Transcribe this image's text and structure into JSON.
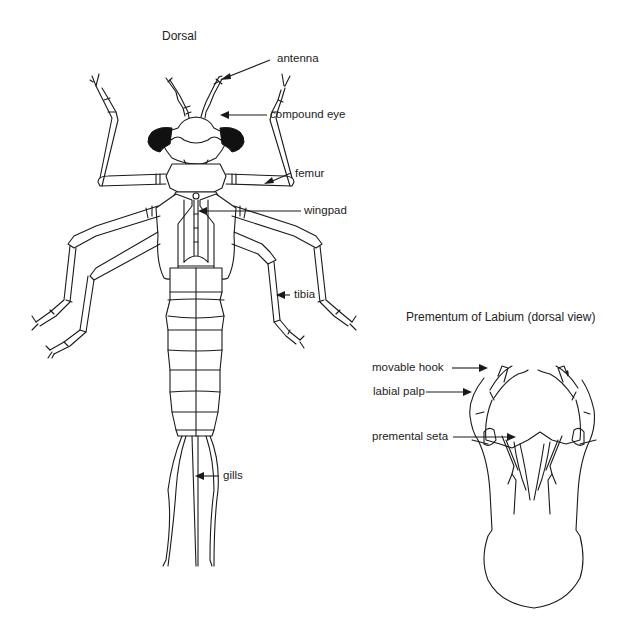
{
  "dorsal_view": {
    "title": "Dorsal",
    "labels": {
      "antenna": "antenna",
      "compound_eye": "compound eye",
      "femur": "femur",
      "wingpad": "wingpad",
      "tibia": "tibia",
      "gills": "gills"
    }
  },
  "prementum_view": {
    "title": "Prementum of Labium (dorsal view)",
    "labels": {
      "movable_hook": "movable hook",
      "labial_palp": "labial palp",
      "premental_seta": "premental seta"
    }
  },
  "colors": {
    "line": "#1a1a1a",
    "background": "#ffffff",
    "eye_fill": "#111111"
  }
}
